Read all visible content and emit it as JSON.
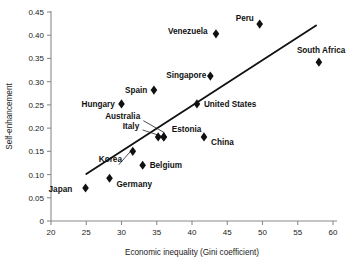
{
  "chart_data": {
    "type": "scatter",
    "title": "",
    "xlabel": "Economic inequality (Gini coefficient)",
    "ylabel": "Self-enhancement",
    "xlim": [
      20,
      60
    ],
    "ylim": [
      0,
      0.45
    ],
    "xticks": [
      "20",
      "25",
      "30",
      "35",
      "40",
      "45",
      "50",
      "55",
      "60"
    ],
    "yticks": [
      "0",
      "0.05",
      "0.10",
      "0.15",
      "0.20",
      "0.25",
      "0.30",
      "0.35",
      "0.40",
      "0.45"
    ],
    "grid": false,
    "legend": "none",
    "marker_shape": "diamond",
    "marker_color": "#111111",
    "trend_line": {
      "label": "regression line",
      "x_start": 25.0,
      "y_start": 0.101,
      "x_end": 57.6,
      "y_end": 0.421,
      "color": "#111111"
    },
    "points": [
      {
        "label": "Japan",
        "x": 24.9,
        "y": 0.071,
        "label_dx": -37,
        "label_dy": 3.5,
        "anchor": "start"
      },
      {
        "label": "Germany",
        "x": 28.3,
        "y": 0.092,
        "label_dx": 7,
        "label_dy": 9,
        "anchor": "start"
      },
      {
        "label": "Hungary",
        "x": 30.0,
        "y": 0.252,
        "label_dx": -40,
        "label_dy": 3.0,
        "anchor": "start"
      },
      {
        "label": "Korea",
        "x": 31.6,
        "y": 0.15,
        "label_dx": -34,
        "label_dy": 11,
        "anchor": "start"
      },
      {
        "label": "Belgium",
        "x": 33.0,
        "y": 0.12,
        "label_dx": 7,
        "label_dy": 3.0,
        "anchor": "start"
      },
      {
        "label": "Spain",
        "x": 34.6,
        "y": 0.282,
        "label_dx": -29,
        "label_dy": 3.0,
        "anchor": "start"
      },
      {
        "label": "Australia",
        "x": 35.2,
        "y": 0.181,
        "label_dx": -53,
        "label_dy": -18,
        "anchor": "start"
      },
      {
        "label": "Italy",
        "x": 36.0,
        "y": 0.181,
        "label_dx": -41,
        "label_dy": -8,
        "anchor": "start"
      },
      {
        "label": "Estonia",
        "x": 36.0,
        "y": 0.181,
        "label_dx": 8,
        "label_dy": -5,
        "anchor": "start"
      },
      {
        "label": "United States",
        "x": 40.7,
        "y": 0.252,
        "label_dx": 7,
        "label_dy": 3.0,
        "anchor": "start"
      },
      {
        "label": "China",
        "x": 41.7,
        "y": 0.181,
        "label_dx": 7,
        "label_dy": 8,
        "anchor": "start"
      },
      {
        "label": "Singapore",
        "x": 42.6,
        "y": 0.312,
        "label_dx": -44,
        "label_dy": 2.0,
        "anchor": "start"
      },
      {
        "label": "Venezuela",
        "x": 43.4,
        "y": 0.403,
        "label_dx": -48,
        "label_dy": 0.5,
        "anchor": "start"
      },
      {
        "label": "Peru",
        "x": 49.6,
        "y": 0.424,
        "label_dx": -24,
        "label_dy": -3,
        "anchor": "start"
      },
      {
        "label": "South Africa",
        "x": 58.0,
        "y": 0.342,
        "label_dx": -22,
        "label_dy": -9,
        "anchor": "start"
      }
    ],
    "leader_lines": [
      {
        "name": "australia-leader",
        "x1": 33.1,
        "y1": 0.216,
        "x2": 36.1,
        "y2": 0.19
      },
      {
        "name": "italy-leader",
        "x1": 33.0,
        "y1": 0.196,
        "x2": 35.6,
        "y2": 0.183
      },
      {
        "name": "korea-leader",
        "x1": 29.6,
        "y1": 0.121,
        "x2": 31.4,
        "y2": 0.152
      }
    ]
  }
}
